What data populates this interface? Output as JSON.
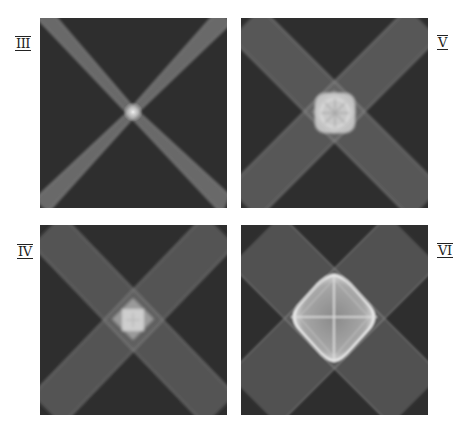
{
  "figure": {
    "panels": [
      {
        "id": "III",
        "label": "III",
        "position": "top-left",
        "band_width": 14,
        "center_shape": "point",
        "center_size": 8
      },
      {
        "id": "V",
        "label": "V",
        "position": "top-right",
        "band_width": 36,
        "center_shape": "rounded-square",
        "center_size": 40
      },
      {
        "id": "IV",
        "label": "IV",
        "position": "bottom-left",
        "band_width": 30,
        "center_shape": "diamond-square",
        "center_size": 30
      },
      {
        "id": "VI",
        "label": "VI",
        "position": "bottom-right",
        "band_width": 60,
        "center_shape": "rounded-diamond",
        "center_size": 92
      }
    ],
    "colors": {
      "panel_background": "#2e2e2e",
      "band": "#8a8a8a",
      "band_edge": "#b5b5b5",
      "center_glow": "#e6e6e6",
      "label": "#222222",
      "page_background": "#ffffff"
    }
  }
}
